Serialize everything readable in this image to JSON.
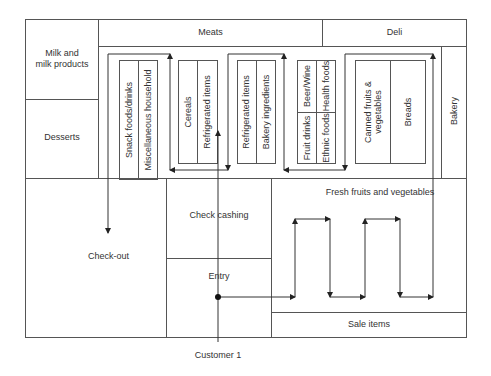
{
  "diagram": {
    "departments": {
      "meats": "Meats",
      "deli": "Deli",
      "milk": "Milk and\nmilk products",
      "desserts": "Desserts",
      "bakery": "Bakery",
      "checkout": "Check-out",
      "check_cashing": "Check cashing",
      "entry": "Entry",
      "fresh_fruits": "Fresh fruits and vegetables",
      "sale_items": "Sale items"
    },
    "aisles": [
      {
        "left": "Snack foods/drinks",
        "right": "Miscellaneous household"
      },
      {
        "left": "Cereals",
        "right": "Refrigerated items"
      },
      {
        "left": "Refrigerated items",
        "right": "Bakery ingredients"
      },
      {
        "top_left": "Beer/Wine",
        "top_right": "Health foods",
        "bottom_left": "Fruit drinks",
        "bottom_right": "Ethnic foods"
      },
      {
        "left": "Canned fruits &\nvegetables",
        "right": "Breads"
      }
    ],
    "customer_label": "Customer 1",
    "colors": {
      "line": "#555555",
      "arrow": "#222222",
      "text": "#333333",
      "background": "#ffffff"
    }
  }
}
